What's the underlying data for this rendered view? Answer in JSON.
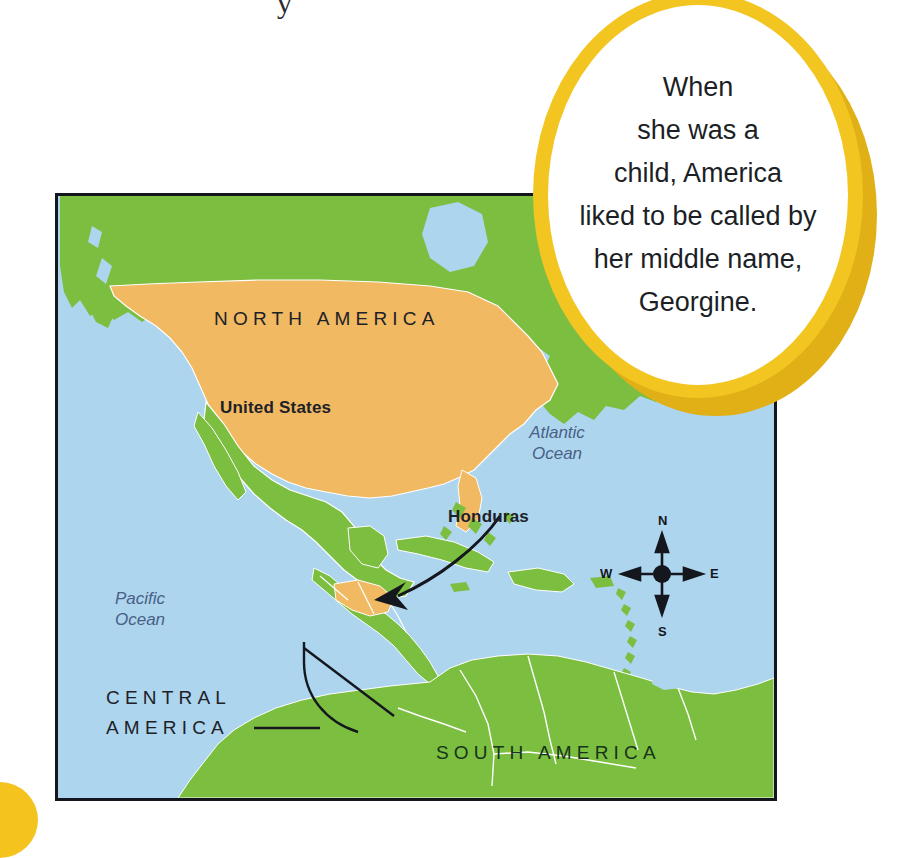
{
  "page": {
    "top_bleed_glyph": "y",
    "background_color": "#ffffff"
  },
  "callout": {
    "text": "When\nshe was a\nchild, America\nliked to be called by\nher middle name,\nGeorgine.",
    "ring_color": "#F2C520",
    "shadow_color": "#E0B016",
    "inner_color": "#ffffff",
    "text_color": "#1c1f26"
  },
  "corner_marker": {
    "color": "#F5C31E"
  },
  "map": {
    "frame_color": "#13161c",
    "ocean_color": "#ADD5EE",
    "land_color": "#7CBE3F",
    "highlight_color": "#F0B962",
    "border_line_color": "#ffffff",
    "labels": {
      "north_america": "NORTH AMERICA",
      "south_america": "SOUTH AMERICA",
      "central_america": "CENTRAL\nAMERICA",
      "united_states": "United States",
      "honduras": "Honduras",
      "atlantic_ocean": "Atlantic\nOcean",
      "pacific_ocean": "Pacific\nOcean"
    },
    "compass": {
      "north": "N",
      "east": "E",
      "south": "S",
      "west": "W"
    }
  }
}
